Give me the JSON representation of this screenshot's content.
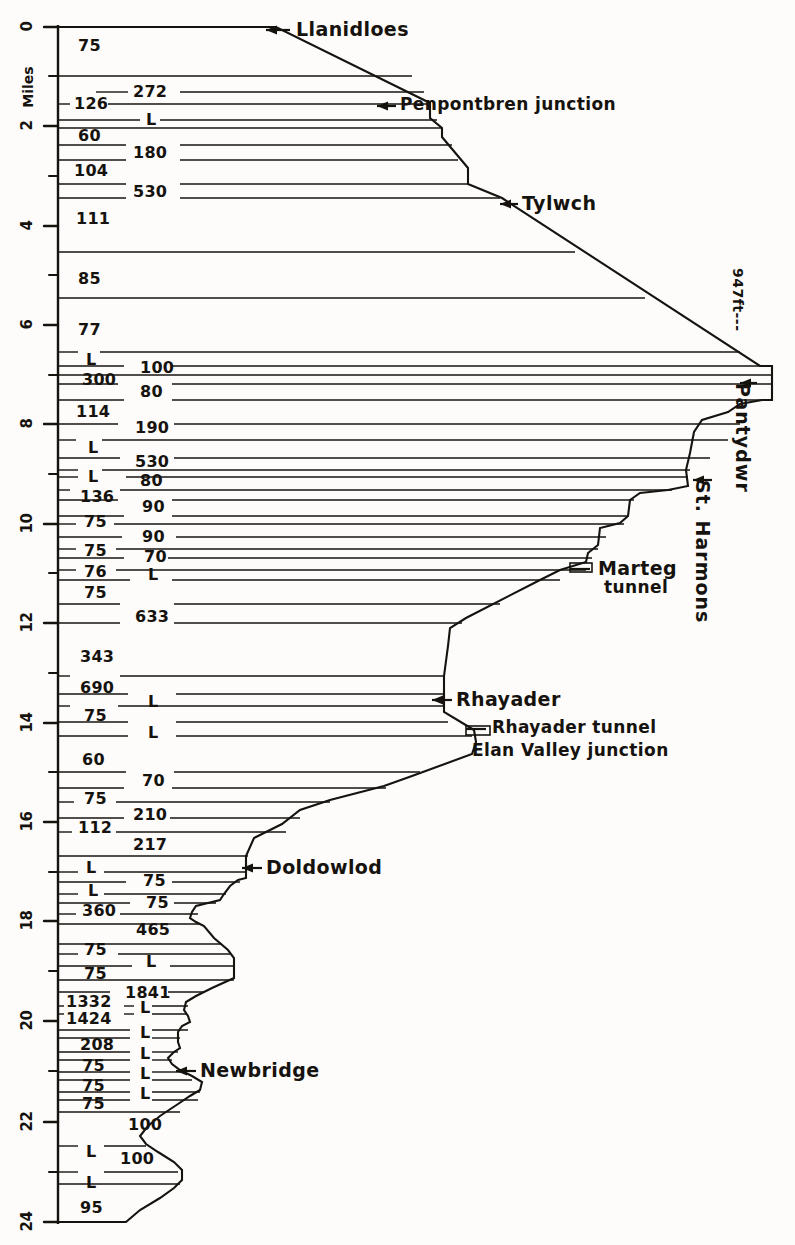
{
  "figure": {
    "type": "railway-gradient-profile",
    "axis_label": "Miles",
    "summit_label": "947ft---",
    "x_range_px": [
      0,
      795
    ],
    "y_range_px": [
      0,
      1245
    ]
  },
  "axis": {
    "label": "Miles",
    "major_ticks": [
      {
        "value": "0",
        "y": 27
      },
      {
        "value": "2",
        "y": 126
      },
      {
        "value": "4",
        "y": 226
      },
      {
        "value": "6",
        "y": 325
      },
      {
        "value": "8",
        "y": 424
      },
      {
        "value": "10",
        "y": 524
      },
      {
        "value": "12",
        "y": 623
      },
      {
        "value": "14",
        "y": 723
      },
      {
        "value": "16",
        "y": 822
      },
      {
        "value": "18",
        "y": 921
      },
      {
        "value": "20",
        "y": 1021
      },
      {
        "value": "22",
        "y": 1122
      },
      {
        "value": "24",
        "y": 1222
      }
    ],
    "minor_ticks_y": [
      76,
      176,
      275,
      375,
      474,
      573,
      673,
      772,
      872,
      971,
      1071,
      1172
    ]
  },
  "stations": [
    {
      "name": "Llanidloes",
      "y": 30,
      "side": "right",
      "arrow": true,
      "label_x": 296,
      "arrow_x1": 266,
      "arrow_x2": 290
    },
    {
      "name": "Penpontbren junction",
      "y": 106,
      "side": "right",
      "arrow": true,
      "label_x": 400,
      "arrow_x1": 377,
      "arrow_x2": 396
    },
    {
      "name": "Tylwch",
      "y": 204,
      "side": "right",
      "arrow": true,
      "label_x": 522,
      "arrow_x1": 500,
      "arrow_x2": 518
    },
    {
      "name": "Pantydwr",
      "y": 383,
      "side": "vertical",
      "arrow": true,
      "label_x": 752,
      "arrow_x1": 740,
      "arrow_x2": 757
    },
    {
      "name": "St. Harmons",
      "y": 480,
      "side": "vertical",
      "arrow": true,
      "label_x": 712,
      "arrow_x1": 693,
      "arrow_x2": 712
    },
    {
      "name": "Marteg",
      "y": 569,
      "side": "right",
      "arrow": false,
      "label_x": 598,
      "arrow_x1": 570,
      "arrow_x2": 590
    },
    {
      "name": "tunnel",
      "y": 589,
      "side": "right",
      "arrow": false,
      "label_x": 604,
      "arrow_x1": 0,
      "arrow_x2": 0
    },
    {
      "name": "Rhayader",
      "y": 700,
      "side": "right",
      "arrow": true,
      "label_x": 456,
      "arrow_x1": 432,
      "arrow_x2": 452
    },
    {
      "name": "Rhayader tunnel",
      "y": 729,
      "side": "right",
      "arrow": false,
      "label_x": 492,
      "arrow_x1": 466,
      "arrow_x2": 486
    },
    {
      "name": "Elan Valley junction",
      "y": 752,
      "side": "right",
      "arrow": false,
      "label_x": 472,
      "arrow_x1": 0,
      "arrow_x2": 0
    },
    {
      "name": "Doldowlod",
      "y": 868,
      "side": "right",
      "arrow": true,
      "label_x": 266,
      "arrow_x1": 242,
      "arrow_x2": 262
    },
    {
      "name": "Newbridge",
      "y": 1071,
      "side": "right",
      "arrow": true,
      "label_x": 200,
      "arrow_x1": 176,
      "arrow_x2": 196
    }
  ],
  "summit": {
    "text": "947ft---",
    "x": 745,
    "y": 268
  },
  "gradients": [
    {
      "value": "75",
      "x": 78,
      "y": 46
    },
    {
      "value": "126",
      "x": 74,
      "y": 104
    },
    {
      "value": "272",
      "x": 133,
      "y": 92
    },
    {
      "value": "60",
      "x": 78,
      "y": 136
    },
    {
      "value": "L",
      "x": 146,
      "y": 120
    },
    {
      "value": "180",
      "x": 133,
      "y": 153
    },
    {
      "value": "104",
      "x": 74,
      "y": 171
    },
    {
      "value": "530",
      "x": 133,
      "y": 192
    },
    {
      "value": "111",
      "x": 76,
      "y": 219
    },
    {
      "value": "85",
      "x": 78,
      "y": 279
    },
    {
      "value": "77",
      "x": 78,
      "y": 330
    },
    {
      "value": "L",
      "x": 86,
      "y": 360
    },
    {
      "value": "300",
      "x": 82,
      "y": 380
    },
    {
      "value": "100",
      "x": 140,
      "y": 368
    },
    {
      "value": "80",
      "x": 140,
      "y": 392
    },
    {
      "value": "114",
      "x": 76,
      "y": 412
    },
    {
      "value": "190",
      "x": 135,
      "y": 428
    },
    {
      "value": "L",
      "x": 88,
      "y": 448
    },
    {
      "value": "530",
      "x": 135,
      "y": 462
    },
    {
      "value": "L",
      "x": 88,
      "y": 477
    },
    {
      "value": "80",
      "x": 140,
      "y": 481
    },
    {
      "value": "136",
      "x": 80,
      "y": 497
    },
    {
      "value": "90",
      "x": 142,
      "y": 507
    },
    {
      "value": "75",
      "x": 84,
      "y": 522
    },
    {
      "value": "90",
      "x": 142,
      "y": 537
    },
    {
      "value": "75",
      "x": 84,
      "y": 551
    },
    {
      "value": "70",
      "x": 144,
      "y": 557
    },
    {
      "value": "76",
      "x": 84,
      "y": 572
    },
    {
      "value": "L",
      "x": 148,
      "y": 575
    },
    {
      "value": "75",
      "x": 84,
      "y": 593
    },
    {
      "value": "633",
      "x": 135,
      "y": 617
    },
    {
      "value": "343",
      "x": 80,
      "y": 657
    },
    {
      "value": "690",
      "x": 80,
      "y": 688
    },
    {
      "value": "L",
      "x": 148,
      "y": 702
    },
    {
      "value": "75",
      "x": 84,
      "y": 716
    },
    {
      "value": "L",
      "x": 148,
      "y": 733
    },
    {
      "value": "60",
      "x": 82,
      "y": 760
    },
    {
      "value": "70",
      "x": 142,
      "y": 781
    },
    {
      "value": "75",
      "x": 84,
      "y": 799
    },
    {
      "value": "210",
      "x": 133,
      "y": 815
    },
    {
      "value": "112",
      "x": 78,
      "y": 828
    },
    {
      "value": "217",
      "x": 133,
      "y": 845
    },
    {
      "value": "L",
      "x": 86,
      "y": 868
    },
    {
      "value": "75",
      "x": 143,
      "y": 881
    },
    {
      "value": "L",
      "x": 88,
      "y": 891
    },
    {
      "value": "75",
      "x": 146,
      "y": 903
    },
    {
      "value": "360",
      "x": 82,
      "y": 911
    },
    {
      "value": "465",
      "x": 136,
      "y": 930
    },
    {
      "value": "75",
      "x": 84,
      "y": 950
    },
    {
      "value": "L",
      "x": 146,
      "y": 962
    },
    {
      "value": "75",
      "x": 84,
      "y": 974
    },
    {
      "value": "1332",
      "x": 66,
      "y": 1002
    },
    {
      "value": "1841",
      "x": 125,
      "y": 993
    },
    {
      "value": "L",
      "x": 140,
      "y": 1008
    },
    {
      "value": "1424",
      "x": 66,
      "y": 1019
    },
    {
      "value": "L",
      "x": 140,
      "y": 1033
    },
    {
      "value": "208",
      "x": 80,
      "y": 1045
    },
    {
      "value": "L",
      "x": 140,
      "y": 1054
    },
    {
      "value": "75",
      "x": 82,
      "y": 1066
    },
    {
      "value": "L",
      "x": 140,
      "y": 1074
    },
    {
      "value": "75",
      "x": 82,
      "y": 1086
    },
    {
      "value": "L",
      "x": 140,
      "y": 1094
    },
    {
      "value": "75",
      "x": 82,
      "y": 1104
    },
    {
      "value": "100",
      "x": 128,
      "y": 1125
    },
    {
      "value": "L",
      "x": 86,
      "y": 1152
    },
    {
      "value": "100",
      "x": 120,
      "y": 1159
    },
    {
      "value": "L",
      "x": 86,
      "y": 1183
    },
    {
      "value": "95",
      "x": 80,
      "y": 1208
    }
  ],
  "profile_outline": "M 58,27 L 276,27 L 430,103 L 430,118 L 442,128 L 442,137 L 468,168 L 468,184 L 502,198 L 760,366 L 772,366 L 772,400 L 762,400 L 740,404 L 728,412 L 702,420 L 694,432 L 690,453 L 686,470 L 688,486 L 668,490 L 640,493 L 630,500 L 628,516 L 620,523 L 600,528 L 598,545 L 588,553 L 586,562 L 560,570 L 548,576 L 540,580 L 466,618 L 450,628 L 448,646 L 444,676 L 444,700 L 444,712 L 474,730 L 476,742 L 472,754 L 412,776 L 384,786 L 330,800 L 300,810 L 282,824 L 254,838 L 246,856 L 246,878 L 238,880 L 230,886 L 224,894 L 220,900 L 208,903 L 196,906 L 192,912 L 190,918 L 196,922 L 204,926 L 214,938 L 228,950 L 234,958 L 234,968 L 234,978 L 212,988 L 196,996 L 186,1002 L 184,1010 L 188,1016 L 190,1022 L 182,1026 L 178,1032 L 178,1042 L 180,1048 L 174,1052 L 168,1058 L 172,1064 L 180,1070 L 192,1076 L 202,1082 L 200,1090 L 190,1096 L 178,1104 L 160,1116 L 148,1126 L 140,1136 L 146,1144 L 158,1152 L 174,1162 L 182,1170 L 182,1180 L 174,1188 L 160,1198 L 140,1210 L 126,1222 L 58,1222",
  "hatch_lines": [
    {
      "y1": 76,
      "x1": 58,
      "y2": 76,
      "x2": 412
    },
    {
      "y1": 92,
      "x1": 96,
      "y2": 92,
      "x2": 128
    },
    {
      "y1": 92,
      "x1": 180,
      "y2": 92,
      "x2": 424
    },
    {
      "y1": 104,
      "x1": 58,
      "y2": 104,
      "x2": 70
    },
    {
      "y1": 104,
      "x1": 108,
      "y2": 104,
      "x2": 428
    },
    {
      "y1": 120,
      "x1": 58,
      "y2": 120,
      "x2": 140
    },
    {
      "y1": 120,
      "x1": 160,
      "y2": 120,
      "x2": 437
    },
    {
      "y1": 128,
      "x1": 58,
      "y2": 128,
      "x2": 442
    },
    {
      "y1": 145,
      "x1": 58,
      "y2": 145,
      "x2": 126
    },
    {
      "y1": 145,
      "x1": 180,
      "y2": 145,
      "x2": 452
    },
    {
      "y1": 160,
      "x1": 58,
      "y2": 160,
      "x2": 126
    },
    {
      "y1": 160,
      "x1": 180,
      "y2": 160,
      "x2": 458
    },
    {
      "y1": 184,
      "x1": 58,
      "y2": 184,
      "x2": 126
    },
    {
      "y1": 184,
      "x1": 180,
      "y2": 184,
      "x2": 468
    },
    {
      "y1": 198,
      "x1": 58,
      "y2": 198,
      "x2": 126
    },
    {
      "y1": 198,
      "x1": 180,
      "y2": 198,
      "x2": 500
    },
    {
      "y1": 252,
      "x1": 58,
      "y2": 252,
      "x2": 575
    },
    {
      "y1": 298,
      "x1": 58,
      "y2": 298,
      "x2": 645
    },
    {
      "y1": 352,
      "x1": 58,
      "y2": 352,
      "x2": 78
    },
    {
      "y1": 352,
      "x1": 100,
      "y2": 352,
      "x2": 740
    },
    {
      "y1": 366,
      "x1": 58,
      "y2": 366,
      "x2": 124
    },
    {
      "y1": 366,
      "x1": 172,
      "y2": 366,
      "x2": 760
    },
    {
      "y1": 375,
      "x1": 58,
      "y2": 375,
      "x2": 772
    },
    {
      "y1": 384,
      "x1": 58,
      "y2": 384,
      "x2": 118
    },
    {
      "y1": 384,
      "x1": 172,
      "y2": 384,
      "x2": 772
    },
    {
      "y1": 400,
      "x1": 58,
      "y2": 400,
      "x2": 124
    },
    {
      "y1": 400,
      "x1": 172,
      "y2": 400,
      "x2": 768
    },
    {
      "y1": 424,
      "x1": 58,
      "y2": 424,
      "x2": 118
    },
    {
      "y1": 424,
      "x1": 174,
      "y2": 424,
      "x2": 740
    },
    {
      "y1": 440,
      "x1": 58,
      "y2": 440,
      "x2": 76
    },
    {
      "y1": 440,
      "x1": 102,
      "y2": 440,
      "x2": 728
    },
    {
      "y1": 458,
      "x1": 58,
      "y2": 458,
      "x2": 120
    },
    {
      "y1": 458,
      "x1": 174,
      "y2": 458,
      "x2": 710
    },
    {
      "y1": 470,
      "x1": 58,
      "y2": 470,
      "x2": 78
    },
    {
      "y1": 470,
      "x1": 102,
      "y2": 470,
      "x2": 690
    },
    {
      "y1": 477,
      "x1": 58,
      "y2": 477,
      "x2": 78
    },
    {
      "y1": 477,
      "x1": 126,
      "y2": 477,
      "x2": 688
    },
    {
      "y1": 490,
      "x1": 58,
      "y2": 490,
      "x2": 70
    },
    {
      "y1": 490,
      "x1": 120,
      "y2": 490,
      "x2": 672
    },
    {
      "y1": 500,
      "x1": 58,
      "y2": 500,
      "x2": 118
    },
    {
      "y1": 500,
      "x1": 172,
      "y2": 500,
      "x2": 634
    },
    {
      "y1": 516,
      "x1": 58,
      "y2": 516,
      "x2": 124
    },
    {
      "y1": 516,
      "x1": 172,
      "y2": 516,
      "x2": 628
    },
    {
      "y1": 524,
      "x1": 58,
      "y2": 524,
      "x2": 76
    },
    {
      "y1": 524,
      "x1": 114,
      "y2": 524,
      "x2": 624
    },
    {
      "y1": 537,
      "x1": 58,
      "y2": 537,
      "x2": 122
    },
    {
      "y1": 537,
      "x1": 176,
      "y2": 537,
      "x2": 606
    },
    {
      "y1": 549,
      "x1": 58,
      "y2": 549,
      "x2": 76
    },
    {
      "y1": 549,
      "x1": 116,
      "y2": 549,
      "x2": 598
    },
    {
      "y1": 558,
      "x1": 58,
      "y2": 558,
      "x2": 124
    },
    {
      "y1": 558,
      "x1": 168,
      "y2": 558,
      "x2": 592
    },
    {
      "y1": 570,
      "x1": 58,
      "y2": 570,
      "x2": 76
    },
    {
      "y1": 570,
      "x1": 116,
      "y2": 570,
      "x2": 586
    },
    {
      "y1": 580,
      "x1": 58,
      "y2": 580,
      "x2": 130
    },
    {
      "y1": 580,
      "x1": 172,
      "y2": 580,
      "x2": 560
    },
    {
      "y1": 604,
      "x1": 58,
      "y2": 604,
      "x2": 120
    },
    {
      "y1": 604,
      "x1": 174,
      "y2": 604,
      "x2": 500
    },
    {
      "y1": 623,
      "x1": 58,
      "y2": 623,
      "x2": 120
    },
    {
      "y1": 623,
      "x1": 174,
      "y2": 623,
      "x2": 462
    },
    {
      "y1": 676,
      "x1": 58,
      "y2": 676,
      "x2": 70
    },
    {
      "y1": 676,
      "x1": 120,
      "y2": 676,
      "x2": 444
    },
    {
      "y1": 694,
      "x1": 58,
      "y2": 694,
      "x2": 128
    },
    {
      "y1": 694,
      "x1": 176,
      "y2": 694,
      "x2": 444
    },
    {
      "y1": 706,
      "x1": 58,
      "y2": 706,
      "x2": 70
    },
    {
      "y1": 706,
      "x1": 118,
      "y2": 706,
      "x2": 444
    },
    {
      "y1": 722,
      "x1": 58,
      "y2": 722,
      "x2": 128
    },
    {
      "y1": 722,
      "x1": 176,
      "y2": 722,
      "x2": 448
    },
    {
      "y1": 736,
      "x1": 58,
      "y2": 736,
      "x2": 128
    },
    {
      "y1": 736,
      "x1": 176,
      "y2": 736,
      "x2": 472
    },
    {
      "y1": 772,
      "x1": 58,
      "y2": 772,
      "x2": 126
    },
    {
      "y1": 772,
      "x1": 174,
      "y2": 772,
      "x2": 420
    },
    {
      "y1": 788,
      "x1": 58,
      "y2": 788,
      "x2": 124
    },
    {
      "y1": 788,
      "x1": 172,
      "y2": 788,
      "x2": 386
    },
    {
      "y1": 802,
      "x1": 58,
      "y2": 802,
      "x2": 74
    },
    {
      "y1": 802,
      "x1": 116,
      "y2": 802,
      "x2": 330
    },
    {
      "y1": 818,
      "x1": 58,
      "y2": 818,
      "x2": 124
    },
    {
      "y1": 818,
      "x1": 170,
      "y2": 818,
      "x2": 300
    },
    {
      "y1": 832,
      "x1": 58,
      "y2": 832,
      "x2": 72
    },
    {
      "y1": 832,
      "x1": 116,
      "y2": 832,
      "x2": 286
    },
    {
      "y1": 856,
      "x1": 58,
      "y2": 856,
      "x2": 248
    },
    {
      "y1": 872,
      "x1": 58,
      "y2": 872,
      "x2": 78
    },
    {
      "y1": 872,
      "x1": 104,
      "y2": 872,
      "x2": 246
    },
    {
      "y1": 882,
      "x1": 58,
      "y2": 882,
      "x2": 126
    },
    {
      "y1": 882,
      "x1": 172,
      "y2": 882,
      "x2": 240
    },
    {
      "y1": 894,
      "x1": 58,
      "y2": 894,
      "x2": 78
    },
    {
      "y1": 894,
      "x1": 104,
      "y2": 894,
      "x2": 226
    },
    {
      "y1": 903,
      "x1": 58,
      "y2": 903,
      "x2": 130
    },
    {
      "y1": 903,
      "x1": 174,
      "y2": 903,
      "x2": 216
    },
    {
      "y1": 914,
      "x1": 58,
      "y2": 914,
      "x2": 76
    },
    {
      "y1": 914,
      "x1": 120,
      "y2": 914,
      "x2": 198
    },
    {
      "y1": 924,
      "x1": 58,
      "y2": 924,
      "x2": 200
    },
    {
      "y1": 944,
      "x1": 58,
      "y2": 944,
      "x2": 222
    },
    {
      "y1": 954,
      "x1": 58,
      "y2": 954,
      "x2": 78
    },
    {
      "y1": 954,
      "x1": 118,
      "y2": 954,
      "x2": 230
    },
    {
      "y1": 966,
      "x1": 58,
      "y2": 966,
      "x2": 132
    },
    {
      "y1": 966,
      "x1": 170,
      "y2": 966,
      "x2": 234
    },
    {
      "y1": 980,
      "x1": 58,
      "y2": 980,
      "x2": 234
    },
    {
      "y1": 992,
      "x1": 58,
      "y2": 992,
      "x2": 110
    },
    {
      "y1": 992,
      "x1": 168,
      "y2": 992,
      "x2": 204
    },
    {
      "y1": 1006,
      "x1": 58,
      "y2": 1006,
      "x2": 64
    },
    {
      "y1": 1006,
      "x1": 124,
      "y2": 1006,
      "x2": 134
    },
    {
      "y1": 1006,
      "x1": 152,
      "y2": 1006,
      "x2": 188
    },
    {
      "y1": 1014,
      "x1": 58,
      "y2": 1014,
      "x2": 64
    },
    {
      "y1": 1014,
      "x1": 124,
      "y2": 1014,
      "x2": 134
    },
    {
      "y1": 1014,
      "x1": 152,
      "y2": 1014,
      "x2": 186
    },
    {
      "y1": 1030,
      "x1": 58,
      "y2": 1030,
      "x2": 130
    },
    {
      "y1": 1030,
      "x1": 152,
      "y2": 1030,
      "x2": 188
    },
    {
      "y1": 1038,
      "x1": 58,
      "y2": 1038,
      "x2": 130
    },
    {
      "y1": 1038,
      "x1": 152,
      "y2": 1038,
      "x2": 180
    },
    {
      "y1": 1052,
      "x1": 58,
      "y2": 1052,
      "x2": 130
    },
    {
      "y1": 1052,
      "x1": 152,
      "y2": 1052,
      "x2": 178
    },
    {
      "y1": 1060,
      "x1": 58,
      "y2": 1060,
      "x2": 130
    },
    {
      "y1": 1060,
      "x1": 152,
      "y2": 1060,
      "x2": 172
    },
    {
      "y1": 1072,
      "x1": 58,
      "y2": 1072,
      "x2": 130
    },
    {
      "y1": 1072,
      "x1": 152,
      "y2": 1072,
      "x2": 182
    },
    {
      "y1": 1080,
      "x1": 58,
      "y2": 1080,
      "x2": 130
    },
    {
      "y1": 1080,
      "x1": 152,
      "y2": 1080,
      "x2": 192
    },
    {
      "y1": 1092,
      "x1": 58,
      "y2": 1092,
      "x2": 130
    },
    {
      "y1": 1092,
      "x1": 152,
      "y2": 1092,
      "x2": 200
    },
    {
      "y1": 1100,
      "x1": 58,
      "y2": 1100,
      "x2": 130
    },
    {
      "y1": 1100,
      "x1": 152,
      "y2": 1100,
      "x2": 198
    },
    {
      "y1": 1112,
      "x1": 58,
      "y2": 1112,
      "x2": 180
    },
    {
      "y1": 1146,
      "x1": 58,
      "y2": 1146,
      "x2": 78
    },
    {
      "y1": 1146,
      "x1": 104,
      "y2": 1146,
      "x2": 146
    },
    {
      "y1": 1172,
      "x1": 58,
      "y2": 1172,
      "x2": 78
    },
    {
      "y1": 1172,
      "x1": 104,
      "y2": 1172,
      "x2": 178
    },
    {
      "y1": 1184,
      "x1": 58,
      "y2": 1184,
      "x2": 180
    }
  ]
}
